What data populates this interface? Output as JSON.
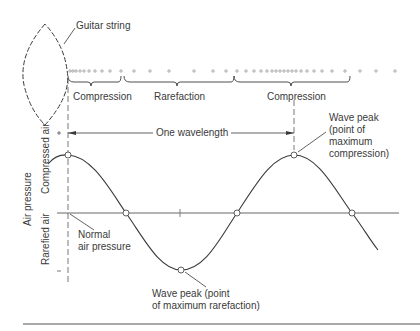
{
  "diagram": {
    "labels": {
      "guitar_string": "Guitar string",
      "compression_1": "Compression",
      "rarefaction": "Rarefaction",
      "compression_2": "Compression",
      "one_wavelength": "One wavelength",
      "wave_peak_max": "Wave peak\n(point of\nmaximum\ncompression)",
      "wave_peak_max_lines": [
        "Wave peak",
        "(point of",
        "maximum",
        "compression)"
      ],
      "wave_peak_min_lines": [
        "Wave peak (point",
        "of maximum rarefaction)"
      ],
      "normal_pressure_lines": [
        "Normal",
        "air pressure"
      ],
      "y_axis": "Air pressure",
      "compressed_air": "Compressed air",
      "rarefied_air": "Rarefied air",
      "plus": "+",
      "minus": "−"
    },
    "colors": {
      "line": "#3a3a3a",
      "axis": "#555555",
      "background": "#ffffff"
    }
  }
}
